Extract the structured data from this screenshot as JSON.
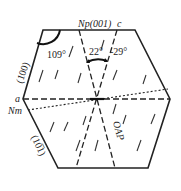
{
  "diagram": {
    "type": "crystal-optical-orientation",
    "shape": "hexagonal section",
    "labels": {
      "top_face": "Np(001)",
      "c_axis": "c",
      "a_axis": "a",
      "nm": "Nm",
      "face_100": "(100)",
      "face_10_1": "(10̅1)",
      "oap": "OAP"
    },
    "angles": {
      "corner_angle": "109°",
      "extinction_1": "22°",
      "extinction_2": "-29°"
    },
    "colors": {
      "line": "#222222",
      "background": "#ffffff"
    }
  }
}
